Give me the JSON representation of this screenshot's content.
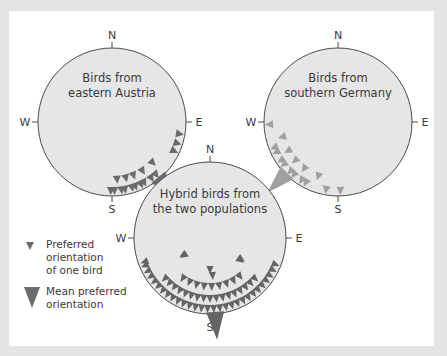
{
  "compasses": [
    {
      "id": "austria",
      "title_lines": [
        "Birds from",
        "eastern Austria"
      ],
      "directions": {
        "n": "N",
        "s": "S",
        "e": "E",
        "w": "W"
      },
      "center": [
        112,
        122
      ],
      "radius": 74,
      "bird_angles_deg": [
        100,
        108,
        115,
        135,
        140,
        145,
        148,
        152,
        155,
        158,
        160,
        163,
        166,
        169,
        172,
        175,
        178,
        181
      ],
      "mean_angle_deg": 140
    },
    {
      "id": "germany",
      "title_lines": [
        "Birds from",
        "southern Germany"
      ],
      "directions": {
        "n": "N",
        "s": "S",
        "e": "E",
        "w": "W"
      },
      "center": [
        338,
        122
      ],
      "radius": 74,
      "bird_angles_deg": [
        268,
        255,
        248,
        244,
        240,
        236,
        232,
        228,
        224,
        220,
        216,
        212,
        208,
        200,
        190,
        178
      ],
      "mean_angle_deg": 225
    },
    {
      "id": "hybrid",
      "title_lines": [
        "Hybrid birds from",
        "the two populations"
      ],
      "directions": {
        "n": "N",
        "s": "S",
        "e": "E",
        "w": "W"
      },
      "center": [
        210,
        238
      ],
      "radius": 76,
      "mean_angle_deg": 176
    }
  ],
  "legend": {
    "single_bird": [
      "Preferred",
      "orientation",
      "of one bird"
    ],
    "mean": [
      "Mean preferred",
      "orientation"
    ]
  },
  "colors": {
    "circle_fill": "#e6e6e6",
    "circle_stroke": "#4a4a4a",
    "austria_marker": "#6b6b6b",
    "germany_marker": "#a0a0a0",
    "hybrid_marker": "#646464",
    "background": "#e4e4e4",
    "panel": "#ffffff"
  }
}
